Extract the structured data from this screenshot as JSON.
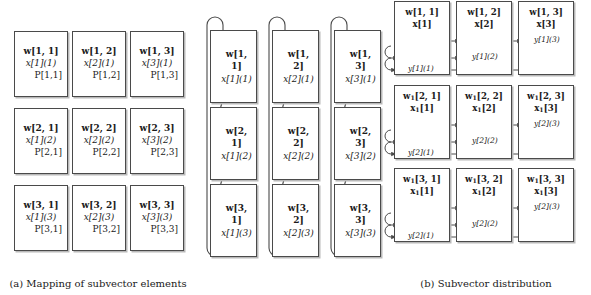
{
  "figure": {
    "panels": [
      {
        "id": "a",
        "caption": "(a) Mapping of subvector elements",
        "cells": [
          [
            {
              "w": "w[1, 1]",
              "x": "x[1](1)",
              "p": "P[1,1]"
            },
            {
              "w": "w[1, 2]",
              "x": "x[2](1)",
              "p": "P[1,2]"
            },
            {
              "w": "w[1, 3]",
              "x": "x[3](1)",
              "p": "P[1,3]"
            }
          ],
          [
            {
              "w": "w[2, 1]",
              "x": "x[1](2)",
              "p": "P[2,1]"
            },
            {
              "w": "w[2, 2]",
              "x": "x[2](2)",
              "p": "P[2,2]"
            },
            {
              "w": "w[2, 3]",
              "x": "x[3](2)",
              "p": "P[2,3]"
            }
          ],
          [
            {
              "w": "w[3, 1]",
              "x": "x[1](3)",
              "p": "P[3,1]"
            },
            {
              "w": "w[3, 2]",
              "x": "x[2](3)",
              "p": "P[3,2]"
            },
            {
              "w": "w[3, 3]",
              "x": "x[3](3)",
              "p": "P[3,3]"
            }
          ]
        ]
      },
      {
        "id": "b",
        "caption": "(b) Subvector distribution",
        "cells": [
          [
            {
              "w": "w[1, 1]",
              "x": "x[1](1)"
            },
            {
              "w": "w[1, 2]",
              "x": "x[2](1)"
            },
            {
              "w": "w[1, 3]",
              "x": "x[3](1)"
            }
          ],
          [
            {
              "w": "w[2, 1]",
              "x": "x[1](2)"
            },
            {
              "w": "w[2, 2]",
              "x": "x[2](2)"
            },
            {
              "w": "w[2, 3]",
              "x": "x[3](2)"
            }
          ],
          [
            {
              "w": "w[3, 1]",
              "x": "x[1](3)"
            },
            {
              "w": "w[3, 2]",
              "x": "x[2](3)"
            },
            {
              "w": "w[3, 3]",
              "x": "x[3](3)"
            }
          ]
        ]
      },
      {
        "id": "c",
        "caption": "(c) Accumulation",
        "cells": [
          [
            {
              "w": "w[1, 1]",
              "wsub": "",
              "x": "x[1]",
              "xsub": "",
              "y": "y[1](1)"
            },
            {
              "w": "w[1, 2]",
              "wsub": "",
              "x": "x[2]",
              "xsub": "",
              "y": "y[1](2)"
            },
            {
              "w": "w[1, 3]",
              "wsub": "",
              "x": "x[3]",
              "xsub": "",
              "y": "y[1](3)"
            }
          ],
          [
            {
              "w": "w",
              "wsub": "1",
              "wrest": "[2, 1]",
              "x": "x",
              "xsub": "1",
              "xrest": "[1]",
              "y": "y[2](1)"
            },
            {
              "w": "w",
              "wsub": "1",
              "wrest": "[2, 2]",
              "x": "x",
              "xsub": "1",
              "xrest": "[2]",
              "y": "y[2](2)"
            },
            {
              "w": "w",
              "wsub": "1",
              "wrest": "[2, 3]",
              "x": "x",
              "xsub": "1",
              "xrest": "[3]",
              "y": "y[2](3)"
            }
          ],
          [
            {
              "w": "w",
              "wsub": "1",
              "wrest": "[3, 1]",
              "x": "x",
              "xsub": "1",
              "xrest": "[1]",
              "y": "y[2](1)"
            },
            {
              "w": "w",
              "wsub": "1",
              "wrest": "[3, 2]",
              "x": "x",
              "xsub": "1",
              "xrest": "[2]",
              "y": "y[2](2)"
            },
            {
              "w": "w",
              "wsub": "1",
              "wrest": "[3, 3]",
              "x": "x",
              "xsub": "1",
              "xrest": "[3]",
              "y": "y[2](3)"
            }
          ]
        ],
        "adder_symbol": "⊕"
      }
    ],
    "colors": {
      "line": "#4a4a4a",
      "shadow": "#b9b9b9",
      "text": "#1a1a1a",
      "background": "#ffffff"
    }
  }
}
